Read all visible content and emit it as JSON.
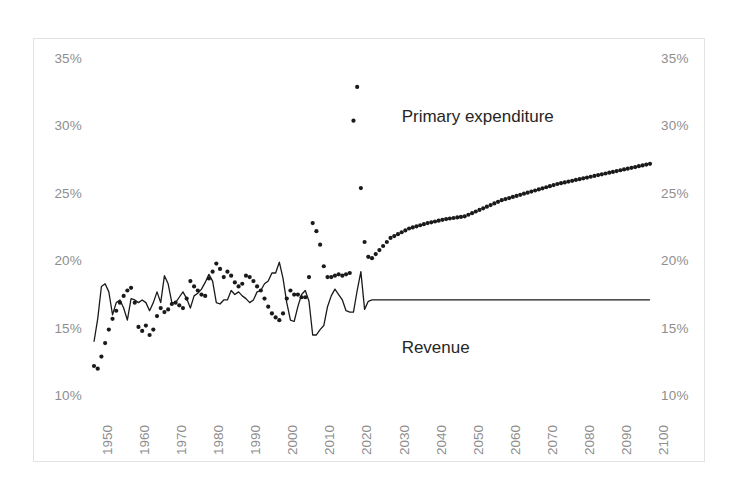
{
  "chart_data": {
    "type": "line",
    "title": "",
    "subtitle": "",
    "xlabel": "",
    "ylabel": "",
    "xlim": [
      1950,
      2100
    ],
    "ylim": [
      10,
      35
    ],
    "y_tick_labels": [
      "35%",
      "30%",
      "25%",
      "20%",
      "15%",
      "10%"
    ],
    "y_tick_values": [
      35,
      30,
      25,
      20,
      15,
      10
    ],
    "y_axis_right_tick_labels": [
      "35%",
      "30%",
      "25%",
      "20%",
      "15%",
      "10%"
    ],
    "x_tick_labels": [
      "1950",
      "1960",
      "1970",
      "1980",
      "1990",
      "2000",
      "2010",
      "2020",
      "2030",
      "2040",
      "2050",
      "2060",
      "2070",
      "2080",
      "2090",
      "2100"
    ],
    "x_tick_values": [
      1950,
      1960,
      1970,
      1980,
      1990,
      2000,
      2010,
      2020,
      2030,
      2040,
      2050,
      2060,
      2070,
      2080,
      2090,
      2100
    ],
    "grid": false,
    "legend_position": "inline-annotation",
    "annotations": [
      {
        "text": "Primary expenditure",
        "x": 2033,
        "y": 30.8
      },
      {
        "text": "Revenue",
        "x": 2033,
        "y": 13.6
      }
    ],
    "series": [
      {
        "name": "Primary expenditure",
        "style": "dotted",
        "color": "#1a1a1a",
        "x": [
          1950,
          1951,
          1952,
          1953,
          1954,
          1955,
          1956,
          1957,
          1958,
          1959,
          1960,
          1961,
          1962,
          1963,
          1964,
          1965,
          1966,
          1967,
          1968,
          1969,
          1970,
          1971,
          1972,
          1973,
          1974,
          1975,
          1976,
          1977,
          1978,
          1979,
          1980,
          1981,
          1982,
          1983,
          1984,
          1985,
          1986,
          1987,
          1988,
          1989,
          1990,
          1991,
          1992,
          1993,
          1994,
          1995,
          1996,
          1997,
          1998,
          1999,
          2000,
          2001,
          2002,
          2003,
          2004,
          2005,
          2006,
          2007,
          2008,
          2009,
          2010,
          2011,
          2012,
          2013,
          2014,
          2015,
          2016,
          2017,
          2018,
          2019,
          2020,
          2021,
          2022,
          2023,
          2024,
          2025,
          2030,
          2035,
          2040,
          2045,
          2050,
          2055,
          2060,
          2065,
          2070,
          2075,
          2080,
          2085,
          2090,
          2095,
          2100
        ],
        "values": [
          12.3,
          12.1,
          13.0,
          14.0,
          15.0,
          15.8,
          16.4,
          17.0,
          17.5,
          17.9,
          18.1,
          17.0,
          15.2,
          14.9,
          15.3,
          14.6,
          15.0,
          16.0,
          16.6,
          16.3,
          16.5,
          16.9,
          17.0,
          16.8,
          16.6,
          17.3,
          18.6,
          18.2,
          17.9,
          17.6,
          17.5,
          18.8,
          19.3,
          19.9,
          19.5,
          18.9,
          19.3,
          19.0,
          18.5,
          18.2,
          18.4,
          19.0,
          18.9,
          18.6,
          18.2,
          17.9,
          17.3,
          16.7,
          16.2,
          15.9,
          15.7,
          16.2,
          17.3,
          17.9,
          17.6,
          17.6,
          17.4,
          17.4,
          18.9,
          22.9,
          22.3,
          21.3,
          19.7,
          18.9,
          18.9,
          19.0,
          19.1,
          19.0,
          19.1,
          19.2,
          30.5,
          33.0,
          25.5,
          21.5,
          20.4,
          20.3,
          21.8,
          22.5,
          22.9,
          23.2,
          23.4,
          24.0,
          24.6,
          25.0,
          25.4,
          25.8,
          26.1,
          26.4,
          26.7,
          27.0,
          27.3
        ]
      },
      {
        "name": "Revenue",
        "style": "solid",
        "color": "#1a1a1a",
        "x": [
          1950,
          1951,
          1952,
          1953,
          1954,
          1955,
          1956,
          1957,
          1958,
          1959,
          1960,
          1961,
          1962,
          1963,
          1964,
          1965,
          1966,
          1967,
          1968,
          1969,
          1970,
          1971,
          1972,
          1973,
          1974,
          1975,
          1976,
          1977,
          1978,
          1979,
          1980,
          1981,
          1982,
          1983,
          1984,
          1985,
          1986,
          1987,
          1988,
          1989,
          1990,
          1991,
          1992,
          1993,
          1994,
          1995,
          1996,
          1997,
          1998,
          1999,
          2000,
          2001,
          2002,
          2003,
          2004,
          2005,
          2006,
          2007,
          2008,
          2009,
          2010,
          2011,
          2012,
          2013,
          2014,
          2015,
          2016,
          2017,
          2018,
          2019,
          2020,
          2021,
          2022,
          2023,
          2024,
          2025,
          2030,
          2035,
          2040,
          2045,
          2050,
          2055,
          2060,
          2065,
          2070,
          2075,
          2080,
          2085,
          2090,
          2095,
          2100
        ],
        "values": [
          14.1,
          15.8,
          18.2,
          18.4,
          17.8,
          16.1,
          17.0,
          17.2,
          16.6,
          15.7,
          17.3,
          17.2,
          17.0,
          17.2,
          17.0,
          16.4,
          17.0,
          17.8,
          17.0,
          19.0,
          18.4,
          17.0,
          17.0,
          17.4,
          17.8,
          17.3,
          16.6,
          17.5,
          17.7,
          18.0,
          18.5,
          19.1,
          18.6,
          17.0,
          16.9,
          17.2,
          17.2,
          17.9,
          17.6,
          17.8,
          17.5,
          17.3,
          17.0,
          17.2,
          17.8,
          17.9,
          18.4,
          18.6,
          19.2,
          19.2,
          20.0,
          18.8,
          17.0,
          15.7,
          15.6,
          16.7,
          17.6,
          17.9,
          17.1,
          14.6,
          14.6,
          15.0,
          15.3,
          16.7,
          17.5,
          18.0,
          17.6,
          17.2,
          16.4,
          16.3,
          16.3,
          17.9,
          19.3,
          16.5,
          17.1,
          17.2,
          17.2,
          17.2,
          17.2,
          17.2,
          17.2,
          17.2,
          17.2,
          17.2,
          17.2,
          17.2,
          17.2,
          17.2,
          17.2,
          17.2,
          17.2
        ]
      }
    ]
  },
  "axes": {
    "left_labels": [
      "35%",
      "30%",
      "25%",
      "20%",
      "15%",
      "10%"
    ],
    "right_labels": [
      "35%",
      "30%",
      "25%",
      "20%",
      "15%",
      "10%"
    ],
    "x_labels": [
      "1950",
      "1960",
      "1970",
      "1980",
      "1990",
      "2000",
      "2010",
      "2020",
      "2030",
      "2040",
      "2050",
      "2060",
      "2070",
      "2080",
      "2090",
      "2100"
    ]
  },
  "labels": {
    "expenditure": "Primary expenditure",
    "revenue": "Revenue"
  },
  "colors": {
    "series": "#1a1a1a",
    "axis_text": "#8e8e8e",
    "annotation_text": "#262626",
    "frame": "#e3e3e3",
    "background": "#ffffff"
  }
}
